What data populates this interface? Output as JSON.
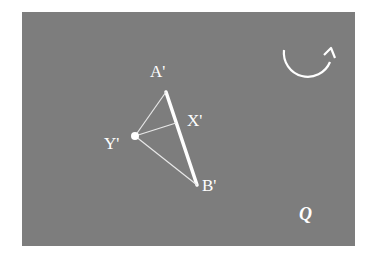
{
  "diagram": {
    "background_color": "#7d7d7d",
    "stroke_color": "#ffffff",
    "labels": {
      "a": "A'",
      "x": "X'",
      "y": "Y'",
      "b": "B'",
      "plane": "Q"
    },
    "points": {
      "A": [
        166,
        92
      ],
      "X": [
        176,
        123
      ],
      "Y": [
        135,
        136
      ],
      "B": [
        197,
        185
      ]
    },
    "segments": [
      {
        "from": "A",
        "to": "B",
        "style": "thick"
      },
      {
        "from": "Y",
        "to": "A",
        "style": "thin"
      },
      {
        "from": "Y",
        "to": "X",
        "style": "thin"
      },
      {
        "from": "Y",
        "to": "B",
        "style": "thin"
      }
    ],
    "rotation_arrow": "clockwise-arc-arrow"
  }
}
